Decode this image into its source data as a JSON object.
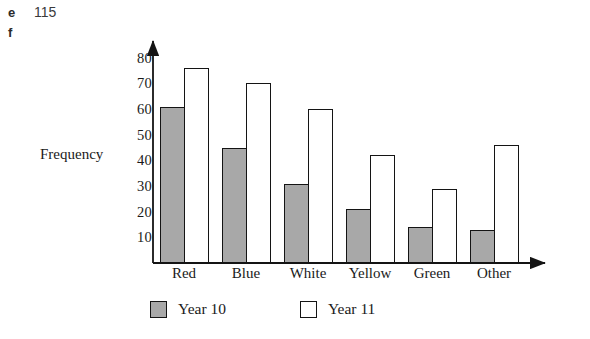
{
  "margin_notes": [
    {
      "letter": "e",
      "number": "115"
    },
    {
      "letter": "f",
      "number": ""
    }
  ],
  "colors": {
    "year10_fill": "#a8a8a8",
    "year11_fill": "#ffffff",
    "outline": "#141414"
  },
  "legend": {
    "items": [
      {
        "label": "Year 10",
        "swatch": "year10"
      },
      {
        "label": "Year 11",
        "swatch": "year11"
      }
    ]
  },
  "chart_data": {
    "type": "bar",
    "title": "",
    "xlabel": "",
    "ylabel": "Frequency",
    "categories": [
      "Red",
      "Blue",
      "White",
      "Yellow",
      "Green",
      "Other"
    ],
    "series": [
      {
        "name": "Year 10",
        "values": [
          61,
          45,
          31,
          21,
          14,
          13
        ]
      },
      {
        "name": "Year 11",
        "values": [
          76,
          70,
          60,
          42,
          29,
          46
        ]
      }
    ],
    "ylim": [
      0,
      85
    ],
    "yticks": [
      10,
      20,
      30,
      40,
      50,
      60,
      70,
      80
    ],
    "grid": false,
    "legend_position": "bottom",
    "axis_arrows": true
  }
}
